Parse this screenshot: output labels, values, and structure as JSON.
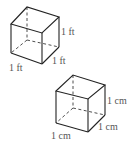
{
  "cubes": [
    {
      "unit": "ft",
      "labels": {
        "height": "1 ft",
        "width": "1 ft",
        "depth": "1 ft"
      }
    },
    {
      "unit": "cm",
      "labels": {
        "height": "1 cm",
        "width": "1 cm",
        "depth": "1 cm"
      }
    }
  ],
  "colors": {
    "edge": "#222222",
    "label": "#555555"
  }
}
